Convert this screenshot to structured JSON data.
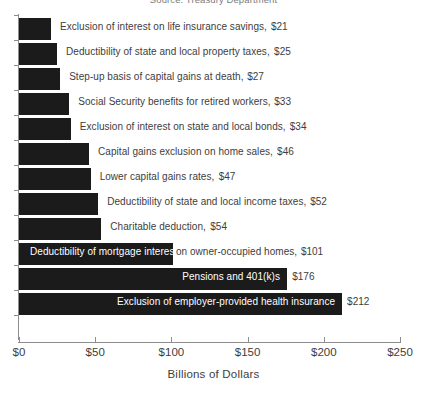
{
  "source_credit": "Source: Treasury Department",
  "chart_data": {
    "type": "bar",
    "orientation": "horizontal",
    "title": "",
    "xlabel": "Billions of Dollars",
    "ylabel": "",
    "xlim": [
      0,
      250
    ],
    "grid": false,
    "legend": false,
    "tick_labels": [
      "$0",
      "$50",
      "$100",
      "$150",
      "$200",
      "$250"
    ],
    "ticks": [
      0,
      50,
      100,
      150,
      200,
      250
    ],
    "bar_color": "#1b1b1b",
    "categories": [
      "Exclusion of interest on life insurance savings",
      "Deductibility of state and local property taxes",
      "Step-up basis of capital gains at death",
      "Social Security benefits for retired workers",
      "Exclusion of interest on state and local bonds",
      "Capital gains exclusion on home sales",
      "Lower capital gains rates",
      "Deductibility of state and local income taxes",
      "Charitable deduction",
      "Deductibility of mortgage interest on owner-occupied homes",
      "Pensions and 401(k)s",
      "Exclusion of employer-provided health insurance"
    ],
    "values": [
      21,
      25,
      27,
      33,
      34,
      46,
      47,
      52,
      54,
      101,
      176,
      212
    ],
    "value_labels": [
      "$21",
      "$25",
      "$27",
      "$33",
      "$34",
      "$46",
      "$47",
      "$52",
      "$54",
      "$101",
      "$176",
      "$212"
    ],
    "bars": [
      {
        "label": "Exclusion of interest on life insurance savings",
        "value": 21,
        "value_label": "$21",
        "label_placement": "outside",
        "value_placement": "outside"
      },
      {
        "label": "Deductibility of state and local property taxes",
        "value": 25,
        "value_label": "$25",
        "label_placement": "outside",
        "value_placement": "outside"
      },
      {
        "label": "Step-up basis of capital gains at death",
        "value": 27,
        "value_label": "$27",
        "label_placement": "outside",
        "value_placement": "outside"
      },
      {
        "label": "Social Security benefits for retired workers",
        "value": 33,
        "value_label": "$33",
        "label_placement": "outside",
        "value_placement": "outside"
      },
      {
        "label": "Exclusion of interest on state and local bonds",
        "value": 34,
        "value_label": "$34",
        "label_placement": "outside",
        "value_placement": "outside"
      },
      {
        "label": "Capital gains exclusion on home sales",
        "value": 46,
        "value_label": "$46",
        "label_placement": "outside",
        "value_placement": "outside"
      },
      {
        "label": "Lower capital gains rates",
        "value": 47,
        "value_label": "$47",
        "label_placement": "outside",
        "value_placement": "outside"
      },
      {
        "label": "Deductibility of state and local income taxes",
        "value": 52,
        "value_label": "$52",
        "label_placement": "outside",
        "value_placement": "outside"
      },
      {
        "label": "Charitable deduction",
        "value": 54,
        "value_label": "$54",
        "label_placement": "outside",
        "value_placement": "outside"
      },
      {
        "label": "Deductibility of mortgage interest",
        "label_tail": " on owner-occupied homes,",
        "value": 101,
        "value_label": "$101",
        "label_placement": "inside-split",
        "value_placement": "outside"
      },
      {
        "label": "Pensions and 401(k)s",
        "value": 176,
        "value_label": "$176",
        "label_placement": "inside",
        "value_placement": "inside-after"
      },
      {
        "label": "Exclusion of employer-provided health insurance",
        "value": 212,
        "value_label": "$212",
        "label_placement": "inside",
        "value_placement": "inside-after"
      }
    ]
  }
}
